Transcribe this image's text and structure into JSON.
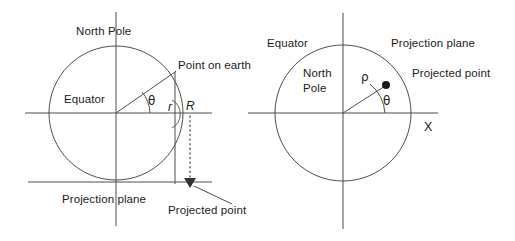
{
  "figure": {
    "stroke_color": "#4d4d4d",
    "text_color": "#1a1a1a",
    "background": "#ffffff",
    "left_diagram": {
      "name": "earth-cross-section",
      "labels": {
        "north_pole": "North Pole",
        "equator": "Equator",
        "point_on_earth": "Point on earth",
        "projection_plane": "Projection plane",
        "projected_point": "Projected point",
        "theta": "θ",
        "r_small": "r",
        "r_large": "R"
      }
    },
    "right_diagram": {
      "name": "polar-projection-plane-view",
      "labels": {
        "equator": "Equator",
        "north_pole_line1": "North",
        "north_pole_line2": "Pole",
        "projection_plane": "Projection plane",
        "projected_point": "Projected point",
        "rho": "ρ",
        "theta": "θ",
        "x_axis": "X"
      }
    }
  }
}
